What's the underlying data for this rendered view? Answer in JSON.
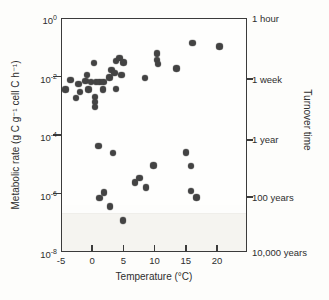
{
  "colors": {
    "ink": "#3b3b3b",
    "dot": "#434343",
    "background": "#fdfdfb",
    "plot_background": "#fefefd"
  },
  "chart_data": {
    "type": "scatter",
    "title": "",
    "xlabel": "Temperature (°C)",
    "ylabel": "Metabolic rate (g C g⁻¹ cell C h⁻¹)",
    "right_axis_title": "Turnover time",
    "x_scale": "linear",
    "y_scale": "log",
    "xlim": [
      -5,
      24.8
    ],
    "ylim_log": [
      -8,
      0
    ],
    "grid": false,
    "x_ticks": [
      {
        "label": "-5",
        "t": -5
      },
      {
        "label": "0",
        "t": 0
      },
      {
        "label": "5",
        "t": 5
      },
      {
        "label": "10",
        "t": 10
      },
      {
        "label": "15",
        "t": 15
      },
      {
        "label": "20",
        "t": 20
      }
    ],
    "y_ticks": [
      {
        "base": "10",
        "exp": "0",
        "log_y": 0
      },
      {
        "base": "10",
        "exp": "-2",
        "log_y": -2
      },
      {
        "base": "10",
        "exp": "-4",
        "log_y": -4
      },
      {
        "base": "10",
        "exp": "-6",
        "log_y": -6
      },
      {
        "base": "10",
        "exp": "-8",
        "log_y": -8
      }
    ],
    "right_axis_labels": [
      {
        "label": "1 hour",
        "log_y": 0,
        "tick": false
      },
      {
        "label": "1 week",
        "log_y": -2.09,
        "tick": true
      },
      {
        "label": "1 year",
        "log_y": -4.17,
        "tick": true
      },
      {
        "label": "100 years",
        "log_y": -6.12,
        "tick": true
      },
      {
        "label": "10,000 years",
        "log_y": -8,
        "tick": false
      }
    ],
    "points": [
      {
        "t": -4.3,
        "log10_rate": -2.45
      },
      {
        "t": -3.5,
        "log10_rate": -2.11
      },
      {
        "t": -2.6,
        "log10_rate": -2.74
      },
      {
        "t": -2.2,
        "log10_rate": -2.26
      },
      {
        "t": -2.0,
        "log10_rate": -2.52
      },
      {
        "t": -1.1,
        "log10_rate": -2.15
      },
      {
        "t": -0.8,
        "log10_rate": -1.95
      },
      {
        "t": -0.6,
        "log10_rate": -2.45
      },
      {
        "t": -0.2,
        "log10_rate": -2.19
      },
      {
        "t": 0.3,
        "log10_rate": -1.54
      },
      {
        "t": 0.4,
        "log10_rate": -2.71
      },
      {
        "t": 0.4,
        "log10_rate": -2.88
      },
      {
        "t": 0.4,
        "log10_rate": -3.04
      },
      {
        "t": 0.6,
        "log10_rate": -2.19
      },
      {
        "t": 1.2,
        "log10_rate": -2.19
      },
      {
        "t": 1.7,
        "log10_rate": -2.45
      },
      {
        "t": 1.8,
        "log10_rate": -2.19
      },
      {
        "t": 2.8,
        "log10_rate": -2.03
      },
      {
        "t": 3.1,
        "log10_rate": -1.77
      },
      {
        "t": 3.6,
        "log10_rate": -1.88
      },
      {
        "t": 3.8,
        "log10_rate": -1.46
      },
      {
        "t": 3.8,
        "log10_rate": -2.42
      },
      {
        "t": 4.4,
        "log10_rate": -1.37
      },
      {
        "t": 4.7,
        "log10_rate": -1.95
      },
      {
        "t": 5.0,
        "log10_rate": -1.52
      },
      {
        "t": 8.5,
        "log10_rate": -2.06
      },
      {
        "t": 10.4,
        "log10_rate": -1.22
      },
      {
        "t": 10.4,
        "log10_rate": -1.44
      },
      {
        "t": 10.5,
        "log10_rate": -1.58
      },
      {
        "t": 13.5,
        "log10_rate": -1.73
      },
      {
        "t": 16.1,
        "log10_rate": -0.85
      },
      {
        "t": 20.4,
        "log10_rate": -0.98
      },
      {
        "t": 1.0,
        "log10_rate": -4.37
      },
      {
        "t": 3.3,
        "log10_rate": -4.62
      },
      {
        "t": 1.9,
        "log10_rate": -5.96
      },
      {
        "t": 1.2,
        "log10_rate": -6.16
      },
      {
        "t": 2.9,
        "log10_rate": -6.45
      },
      {
        "t": 4.9,
        "log10_rate": -6.92
      },
      {
        "t": 6.9,
        "log10_rate": -5.62
      },
      {
        "t": 7.6,
        "log10_rate": -5.46
      },
      {
        "t": 8.6,
        "log10_rate": -5.8
      },
      {
        "t": 9.8,
        "log10_rate": -5.04
      },
      {
        "t": 15.0,
        "log10_rate": -4.6
      },
      {
        "t": 15.8,
        "log10_rate": -5.07
      },
      {
        "t": 15.8,
        "log10_rate": -5.91
      },
      {
        "t": 16.7,
        "log10_rate": -6.14
      }
    ]
  }
}
